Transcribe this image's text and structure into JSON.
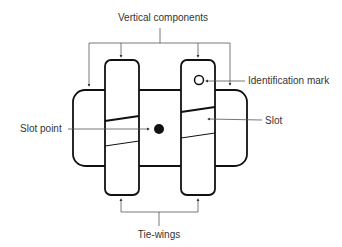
{
  "diagram": {
    "labels": {
      "vertical_components": "Vertical components",
      "identification_mark": "Identification mark",
      "slot_point": "Slot point",
      "slot": "Slot",
      "tie_wings": "Tie-wings"
    },
    "colors": {
      "stroke": "#111111",
      "leader": "#555555",
      "text": "#333333",
      "background": "#ffffff"
    }
  }
}
